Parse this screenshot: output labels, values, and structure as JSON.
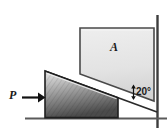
{
  "figure": {
    "type": "engineering-mechanics-diagram",
    "labels": {
      "block": "A",
      "force": "P",
      "angle": "20°"
    },
    "colors": {
      "block_fill": "#e2e2e2",
      "block_stroke": "#4a4a4a",
      "wedge_light": "#cfcfcf",
      "wedge_dark": "#4f4f4f",
      "wedge_stroke": "#2b2b2b",
      "ground_line": "#5a5a5a",
      "wall_line": "#3d3d3d",
      "arrow": "#111111",
      "text": "#1a1a1a",
      "background": "#ffffff"
    },
    "geometry": {
      "incline_angle_deg": 20,
      "wall_x": 157,
      "ground_y": 118,
      "wedge_apex": [
        45,
        71
      ],
      "wedge_base_left": [
        45,
        117
      ],
      "wedge_base_right": [
        118,
        117
      ],
      "block_left": 80,
      "block_top": 28,
      "block_right": 154
    },
    "annotations": {
      "force_arrow_direction": "right",
      "angle_marker": "double-headed-vertical-arrow"
    }
  }
}
